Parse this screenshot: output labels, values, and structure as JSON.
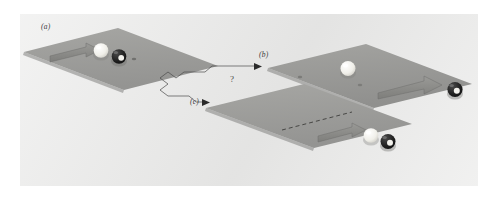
{
  "figure": {
    "caption_labels": {
      "panel_a": "(a)",
      "panel_b": "(b)",
      "panel_c": "(c)"
    },
    "uncertainty_marker": "?",
    "colors": {
      "page_background": "#ffffff",
      "plate_background": "#ececeb",
      "table_surface": "#9b9b99",
      "table_surface_light": "#b4b4b1",
      "arrow_fill": "#8a8a88",
      "arrow_stroke": "#6f6f6d",
      "cue_ball": "#f4f3ef",
      "eight_ball": "#1d1d1d",
      "eight_ball_spot": "#f2f1ec",
      "label_text": "#3b3b3b",
      "connector_line": "#4a4a4a"
    },
    "panels": [
      {
        "id": "a",
        "label": "(a)",
        "description": "cue ball travelling right toward a stationary eight ball",
        "balls": [
          {
            "name": "cue-ball",
            "type": "white",
            "state": "moving"
          },
          {
            "name": "eight-ball",
            "type": "black",
            "state": "stationary"
          }
        ],
        "arrow": {
          "name": "motion-arrow",
          "direction": "right"
        }
      },
      {
        "id": "b",
        "label": "(b)",
        "description": "cue ball stops, eight ball moves off to the right",
        "balls": [
          {
            "name": "cue-ball",
            "type": "white",
            "state": "stationary"
          },
          {
            "name": "eight-ball",
            "type": "black",
            "state": "moving"
          }
        ],
        "arrow": {
          "name": "motion-arrow",
          "direction": "right"
        }
      },
      {
        "id": "c",
        "label": "(c)",
        "description": "cue ball and eight ball travel off together to the right",
        "balls": [
          {
            "name": "cue-ball",
            "type": "white",
            "state": "moving"
          },
          {
            "name": "eight-ball",
            "type": "black",
            "state": "moving"
          }
        ],
        "arrow": {
          "name": "motion-arrow",
          "direction": "right"
        },
        "trajectory": {
          "name": "dashed-trajectory",
          "style": "dashed"
        }
      }
    ],
    "connectors": [
      {
        "name": "branch-to-panel-b",
        "from": "a",
        "to": "b",
        "style": "zigzag-with-arrowhead"
      },
      {
        "name": "branch-to-panel-c",
        "from": "a",
        "to": "c",
        "style": "zigzag-with-arrowhead"
      }
    ]
  }
}
